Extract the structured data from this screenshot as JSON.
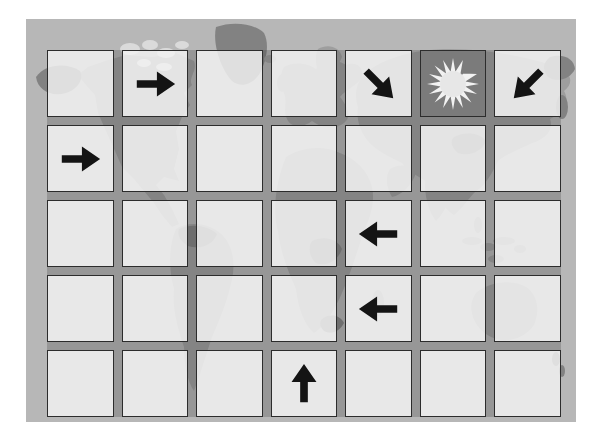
{
  "board": {
    "rows": 5,
    "columns": 7,
    "background": "grayscale-world-map",
    "tokens": [
      {
        "row": 1,
        "col": 2,
        "type": "arrow",
        "direction": "right",
        "icon": "arrow-right-icon"
      },
      {
        "row": 1,
        "col": 5,
        "type": "arrow",
        "direction": "down-right",
        "icon": "arrow-down-right-icon"
      },
      {
        "row": 1,
        "col": 6,
        "type": "sun",
        "direction": null,
        "icon": "sun-icon"
      },
      {
        "row": 1,
        "col": 7,
        "type": "arrow",
        "direction": "down-left",
        "icon": "arrow-down-left-icon"
      },
      {
        "row": 2,
        "col": 1,
        "type": "arrow",
        "direction": "right",
        "icon": "arrow-right-icon"
      },
      {
        "row": 3,
        "col": 5,
        "type": "arrow",
        "direction": "left",
        "icon": "arrow-left-icon"
      },
      {
        "row": 4,
        "col": 5,
        "type": "arrow",
        "direction": "left",
        "icon": "arrow-left-icon"
      },
      {
        "row": 5,
        "col": 4,
        "type": "arrow",
        "direction": "up",
        "icon": "arrow-up-icon"
      }
    ],
    "empty_cell_count": 27
  },
  "colors": {
    "page_background": "#ffffff",
    "ocean": "#b7b7b7",
    "land": "#9e9e9e",
    "land_dark": "#828282",
    "land_light": "#dadada",
    "cell_fill": "#ffffff",
    "cell_border": "#2c2c2c",
    "board_shade": "#282828",
    "sun_cell_background": "#8d8d8d",
    "arrow": "#141414",
    "sun_rays": "#f2f2f2",
    "sun_core": "#e7e7e7"
  }
}
